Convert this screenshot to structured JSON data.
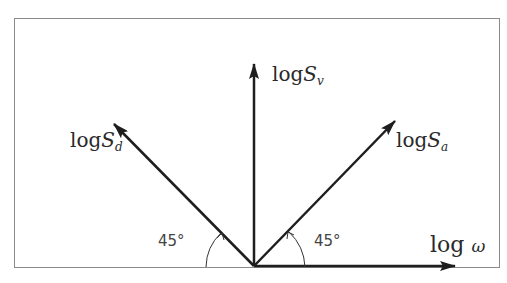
{
  "diagram": {
    "frame_color": "#8a8a8a",
    "line_color": "#1e1e1e",
    "axes": {
      "x_label": {
        "prefix": "log",
        "symbol": "ω"
      },
      "sv_label": {
        "prefix": "log",
        "symbol": "S",
        "subscript": "v"
      },
      "sd_label": {
        "prefix": "log",
        "symbol": "S",
        "subscript": "d"
      },
      "sa_label": {
        "prefix": "log",
        "symbol": "S",
        "subscript": "a"
      }
    },
    "angles": {
      "left": "45°",
      "right": "45°"
    }
  }
}
